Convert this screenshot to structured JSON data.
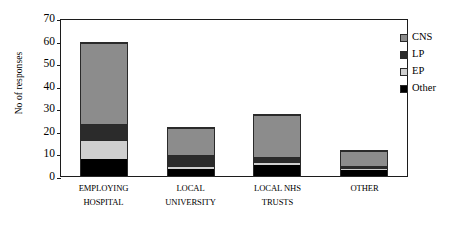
{
  "chart_data": {
    "type": "bar",
    "stacked": true,
    "title": "",
    "xlabel": "",
    "ylabel": "No of responses",
    "ylim": [
      0,
      70
    ],
    "ytick_step": 10,
    "yticks": [
      70,
      60,
      50,
      40,
      30,
      20,
      10,
      0
    ],
    "grid": false,
    "legend_position": "right-outside",
    "categories": [
      "EMPLOYING HOSPITAL",
      "LOCAL UNIVERSITY",
      "LOCAL NHS TRUSTS",
      "OTHER"
    ],
    "category_lines": [
      [
        "EMPLOYING",
        "HOSPITAL"
      ],
      [
        "LOCAL",
        "UNIVERSITY"
      ],
      [
        "LOCAL NHS",
        "TRUSTS"
      ],
      [
        "OTHER",
        ""
      ]
    ],
    "stack_order_bottom_to_top": [
      "Other",
      "EP",
      "LP",
      "CNS"
    ],
    "series": [
      {
        "name": "CNS",
        "color": "#8c8c8c",
        "values": [
          36,
          12,
          18.5,
          6.5
        ]
      },
      {
        "name": "LP",
        "color": "#2b2b2b",
        "values": [
          7,
          5,
          2.5,
          1
        ]
      },
      {
        "name": "EP",
        "color": "#cfcfcf",
        "values": [
          8.5,
          1.5,
          1,
          1
        ]
      },
      {
        "name": "Other",
        "color": "#000000",
        "values": [
          7.5,
          3,
          5,
          2.5
        ]
      }
    ],
    "totals": [
      59,
      21.5,
      27,
      11
    ]
  },
  "legend": {
    "items": [
      {
        "label": "CNS",
        "swatch": "legend-swatch-cns"
      },
      {
        "label": "LP",
        "swatch": "legend-swatch-lp"
      },
      {
        "label": "EP",
        "swatch": "legend-swatch-ep"
      },
      {
        "label": "Other",
        "swatch": "legend-swatch-other"
      }
    ]
  }
}
